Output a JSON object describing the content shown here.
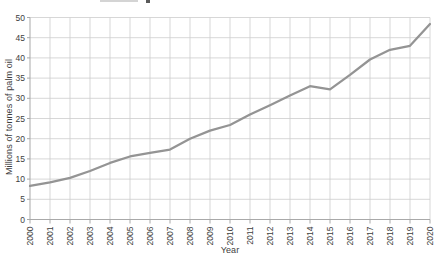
{
  "page": {
    "background_color": "#ffffff",
    "text_color": "#3e3e3e"
  },
  "chart_data": {
    "type": "line",
    "title": "",
    "xlabel": "Year",
    "ylabel": "Millions of tonnes of palm oil",
    "x": [
      2000,
      2001,
      2002,
      2003,
      2004,
      2005,
      2006,
      2007,
      2008,
      2009,
      2010,
      2011,
      2012,
      2013,
      2014,
      2015,
      2016,
      2017,
      2018,
      2019,
      2020
    ],
    "values": [
      8.3,
      9.2,
      10.3,
      12.0,
      14.0,
      15.6,
      16.5,
      17.3,
      20.0,
      22.0,
      23.4,
      26.0,
      28.3,
      30.7,
      33.0,
      32.2,
      35.8,
      39.6,
      42.0,
      43.0,
      48.4
    ],
    "ylim": [
      0,
      50
    ],
    "ytick_step": 5,
    "grid": true,
    "legend": "none",
    "line_color": "#949494",
    "grid_color": "#cdcdcd",
    "axis_color": "#a9a9a9",
    "tick_label_color": "#3e3e3e",
    "line_width": 2.25
  }
}
